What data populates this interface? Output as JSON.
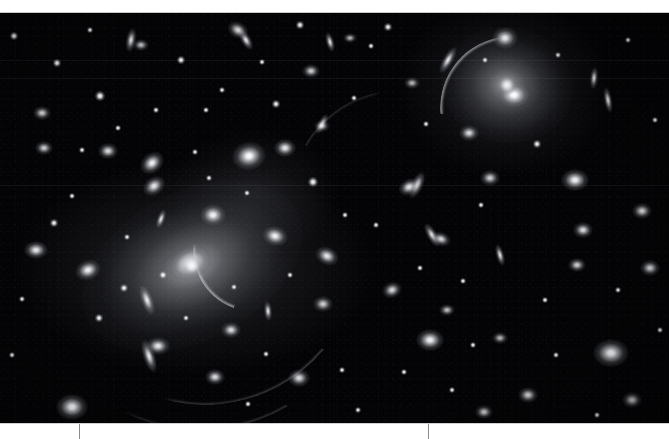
{
  "figure": {
    "kind": "astronomical-image",
    "background_color": "#030305",
    "margin_color": "#ffffff",
    "tick_color": "#8d8d8d",
    "width": 669,
    "height": 439
  },
  "frame": {
    "top_margin_height": 13,
    "image_top": 13,
    "image_bottom": 423,
    "bottom_margin_height": 16
  },
  "axis": {
    "orientation": "horizontal",
    "line_y": 423,
    "ticks": [
      {
        "id": "tick-1",
        "x": 79,
        "label": ""
      },
      {
        "id": "tick-2",
        "x": 428,
        "label": ""
      }
    ],
    "tick_length": 15,
    "labels": []
  },
  "seams": [
    {
      "y": 60,
      "note": "detector seam"
    },
    {
      "y": 78,
      "note": "detector seam"
    },
    {
      "y": 185,
      "note": "detector seam"
    }
  ],
  "objects": {
    "cd_galaxies": [
      {
        "name": "brightest-cluster-galaxy",
        "cx": 192,
        "cy": 266,
        "rx": 118,
        "ry": 74,
        "rot": -28,
        "peak": 1.0
      },
      {
        "name": "cd-galaxy-upper-right",
        "cx": 507,
        "cy": 85,
        "rx": 66,
        "ry": 58,
        "rot": 10,
        "peak": 0.95
      }
    ],
    "galaxies": [
      {
        "cx": 190,
        "cy": 263,
        "rx": 22,
        "ry": 16,
        "rot": -25,
        "b": 1.0
      },
      {
        "cx": 213,
        "cy": 215,
        "rx": 13,
        "ry": 11,
        "rot": 0,
        "b": 0.95
      },
      {
        "cx": 249,
        "cy": 156,
        "rx": 17,
        "ry": 14,
        "rot": -10,
        "b": 1.0
      },
      {
        "cx": 275,
        "cy": 236,
        "rx": 13,
        "ry": 10,
        "rot": 15,
        "b": 0.95
      },
      {
        "cx": 285,
        "cy": 148,
        "rx": 11,
        "ry": 9,
        "rot": 0,
        "b": 0.9
      },
      {
        "cx": 238,
        "cy": 30,
        "rx": 11,
        "ry": 8,
        "rot": 30,
        "b": 0.85
      },
      {
        "cx": 154,
        "cy": 186,
        "rx": 12,
        "ry": 9,
        "rot": -35,
        "b": 0.9
      },
      {
        "cx": 152,
        "cy": 163,
        "rx": 13,
        "ry": 10,
        "rot": -40,
        "b": 0.95
      },
      {
        "cx": 108,
        "cy": 151,
        "rx": 10,
        "ry": 8,
        "rot": 0,
        "b": 0.85
      },
      {
        "cx": 44,
        "cy": 148,
        "rx": 9,
        "ry": 7,
        "rot": 0,
        "b": 0.8
      },
      {
        "cx": 42,
        "cy": 113,
        "rx": 9,
        "ry": 7,
        "rot": 0,
        "b": 0.8
      },
      {
        "cx": 36,
        "cy": 250,
        "rx": 12,
        "ry": 9,
        "rot": 0,
        "b": 0.9
      },
      {
        "cx": 88,
        "cy": 270,
        "rx": 13,
        "ry": 10,
        "rot": -20,
        "b": 0.95
      },
      {
        "cx": 72,
        "cy": 407,
        "rx": 16,
        "ry": 13,
        "rot": 0,
        "b": 1.0
      },
      {
        "cx": 158,
        "cy": 346,
        "rx": 12,
        "ry": 9,
        "rot": 0,
        "b": 0.9
      },
      {
        "cx": 231,
        "cy": 330,
        "rx": 10,
        "ry": 8,
        "rot": 0,
        "b": 0.85
      },
      {
        "cx": 215,
        "cy": 377,
        "rx": 10,
        "ry": 8,
        "rot": 0,
        "b": 0.85
      },
      {
        "cx": 299,
        "cy": 378,
        "rx": 11,
        "ry": 9,
        "rot": 0,
        "b": 0.85
      },
      {
        "cx": 327,
        "cy": 256,
        "rx": 12,
        "ry": 9,
        "rot": 25,
        "b": 0.9
      },
      {
        "cx": 141,
        "cy": 45,
        "rx": 8,
        "ry": 6,
        "rot": 0,
        "b": 0.75
      },
      {
        "cx": 311,
        "cy": 71,
        "rx": 9,
        "ry": 7,
        "rot": 0,
        "b": 0.8
      },
      {
        "cx": 322,
        "cy": 126,
        "rx": 8,
        "ry": 6,
        "rot": 0,
        "b": 0.7
      },
      {
        "cx": 409,
        "cy": 187,
        "rx": 11,
        "ry": 8,
        "rot": -30,
        "b": 0.9
      },
      {
        "cx": 441,
        "cy": 239,
        "rx": 10,
        "ry": 7,
        "rot": 20,
        "b": 0.85
      },
      {
        "cx": 392,
        "cy": 290,
        "rx": 10,
        "ry": 8,
        "rot": -20,
        "b": 0.85
      },
      {
        "cx": 323,
        "cy": 304,
        "rx": 10,
        "ry": 8,
        "rot": 0,
        "b": 0.8
      },
      {
        "cx": 447,
        "cy": 310,
        "rx": 8,
        "ry": 6,
        "rot": 0,
        "b": 0.75
      },
      {
        "cx": 505,
        "cy": 38,
        "rx": 13,
        "ry": 11,
        "rot": 0,
        "b": 1.0
      },
      {
        "cx": 514,
        "cy": 95,
        "rx": 16,
        "ry": 13,
        "rot": 0,
        "b": 1.0
      },
      {
        "cx": 469,
        "cy": 133,
        "rx": 10,
        "ry": 8,
        "rot": 0,
        "b": 0.85
      },
      {
        "cx": 575,
        "cy": 180,
        "rx": 14,
        "ry": 11,
        "rot": 0,
        "b": 0.95
      },
      {
        "cx": 490,
        "cy": 178,
        "rx": 10,
        "ry": 8,
        "rot": 0,
        "b": 0.8
      },
      {
        "cx": 583,
        "cy": 230,
        "rx": 10,
        "ry": 8,
        "rot": 0,
        "b": 0.85
      },
      {
        "cx": 642,
        "cy": 211,
        "rx": 10,
        "ry": 8,
        "rot": 0,
        "b": 0.85
      },
      {
        "cx": 650,
        "cy": 268,
        "rx": 10,
        "ry": 8,
        "rot": 0,
        "b": 0.85
      },
      {
        "cx": 577,
        "cy": 265,
        "rx": 9,
        "ry": 7,
        "rot": 0,
        "b": 0.8
      },
      {
        "cx": 430,
        "cy": 340,
        "rx": 14,
        "ry": 11,
        "rot": 0,
        "b": 0.95
      },
      {
        "cx": 611,
        "cy": 353,
        "rx": 18,
        "ry": 14,
        "rot": 0,
        "b": 1.0
      },
      {
        "cx": 528,
        "cy": 395,
        "rx": 10,
        "ry": 8,
        "rot": 0,
        "b": 0.85
      },
      {
        "cx": 632,
        "cy": 400,
        "rx": 10,
        "ry": 8,
        "rot": 0,
        "b": 0.8
      },
      {
        "cx": 484,
        "cy": 412,
        "rx": 9,
        "ry": 7,
        "rot": 0,
        "b": 0.8
      },
      {
        "cx": 500,
        "cy": 338,
        "rx": 8,
        "ry": 6,
        "rot": 0,
        "b": 0.7
      },
      {
        "cx": 350,
        "cy": 38,
        "rx": 7,
        "ry": 5,
        "rot": 0,
        "b": 0.7
      },
      {
        "cx": 412,
        "cy": 83,
        "rx": 8,
        "ry": 6,
        "rot": 0,
        "b": 0.7
      }
    ],
    "edge_on_galaxies": [
      {
        "cx": 147,
        "cy": 300,
        "rx": 16,
        "ry": 6,
        "rot": 70
      },
      {
        "cx": 149,
        "cy": 356,
        "rx": 17,
        "ry": 6,
        "rot": 72
      },
      {
        "cx": 417,
        "cy": 185,
        "rx": 14,
        "ry": 6,
        "rot": 115
      },
      {
        "cx": 432,
        "cy": 235,
        "rx": 13,
        "ry": 5,
        "rot": 60
      },
      {
        "cx": 131,
        "cy": 40,
        "rx": 12,
        "ry": 5,
        "rot": 100
      },
      {
        "cx": 246,
        "cy": 40,
        "rx": 11,
        "ry": 5,
        "rot": 60
      },
      {
        "cx": 330,
        "cy": 42,
        "rx": 10,
        "ry": 4,
        "rot": 75
      },
      {
        "cx": 322,
        "cy": 124,
        "rx": 11,
        "ry": 4,
        "rot": 118
      },
      {
        "cx": 608,
        "cy": 100,
        "rx": 13,
        "ry": 4,
        "rot": 80
      },
      {
        "cx": 594,
        "cy": 78,
        "rx": 11,
        "ry": 4,
        "rot": 95
      },
      {
        "cx": 448,
        "cy": 60,
        "rx": 15,
        "ry": 5,
        "rot": 120
      },
      {
        "cx": 161,
        "cy": 219,
        "rx": 10,
        "ry": 4,
        "rot": 110
      },
      {
        "cx": 268,
        "cy": 311,
        "rx": 10,
        "ry": 4,
        "rot": 85
      },
      {
        "cx": 500,
        "cy": 255,
        "rx": 11,
        "ry": 4,
        "rot": 75
      }
    ],
    "lensing_arcs": [
      {
        "name": "central-arc",
        "cx": 255,
        "cy": 250,
        "r": 62,
        "start": 200,
        "sweep": 70,
        "thickness": 2.2,
        "brightness": 0.85
      },
      {
        "name": "arc-upper-right",
        "cx": 512,
        "cy": 108,
        "r": 72,
        "start": 265,
        "sweep": 80,
        "thickness": 2.0,
        "brightness": 0.8
      },
      {
        "name": "arc-lower-left",
        "cx": 205,
        "cy": 250,
        "r": 155,
        "start": 130,
        "sweep": 60,
        "thickness": 1.8,
        "brightness": 0.7
      },
      {
        "name": "arc-left",
        "cx": 200,
        "cy": 255,
        "r": 175,
        "start": 150,
        "sweep": 50,
        "thickness": 1.5,
        "brightness": 0.55
      },
      {
        "name": "arc-right-thin",
        "cx": 400,
        "cy": 200,
        "r": 110,
        "start": 300,
        "sweep": 45,
        "thickness": 1.2,
        "brightness": 0.5
      }
    ],
    "stars": [
      {
        "cx": 14,
        "cy": 36,
        "r": 2.0
      },
      {
        "cx": 57,
        "cy": 63,
        "r": 1.6
      },
      {
        "cx": 100,
        "cy": 96,
        "r": 2.2
      },
      {
        "cx": 181,
        "cy": 60,
        "r": 1.8
      },
      {
        "cx": 206,
        "cy": 110,
        "r": 1.5
      },
      {
        "cx": 222,
        "cy": 90,
        "r": 1.4
      },
      {
        "cx": 262,
        "cy": 62,
        "r": 1.5
      },
      {
        "cx": 276,
        "cy": 104,
        "r": 1.6
      },
      {
        "cx": 300,
        "cy": 25,
        "r": 1.6
      },
      {
        "cx": 313,
        "cy": 182,
        "r": 2.2
      },
      {
        "cx": 354,
        "cy": 98,
        "r": 1.4
      },
      {
        "cx": 371,
        "cy": 46,
        "r": 1.5
      },
      {
        "cx": 388,
        "cy": 27,
        "r": 1.6
      },
      {
        "cx": 247,
        "cy": 193,
        "r": 1.4
      },
      {
        "cx": 209,
        "cy": 178,
        "r": 1.3
      },
      {
        "cx": 156,
        "cy": 110,
        "r": 1.3
      },
      {
        "cx": 118,
        "cy": 128,
        "r": 1.4
      },
      {
        "cx": 72,
        "cy": 196,
        "r": 1.4
      },
      {
        "cx": 54,
        "cy": 223,
        "r": 1.6
      },
      {
        "cx": 22,
        "cy": 299,
        "r": 1.5
      },
      {
        "cx": 12,
        "cy": 355,
        "r": 1.4
      },
      {
        "cx": 99,
        "cy": 318,
        "r": 1.6
      },
      {
        "cx": 124,
        "cy": 288,
        "r": 1.6
      },
      {
        "cx": 163,
        "cy": 275,
        "r": 1.8
      },
      {
        "cx": 186,
        "cy": 318,
        "r": 1.4
      },
      {
        "cx": 266,
        "cy": 354,
        "r": 1.4
      },
      {
        "cx": 248,
        "cy": 404,
        "r": 1.5
      },
      {
        "cx": 342,
        "cy": 370,
        "r": 1.4
      },
      {
        "cx": 358,
        "cy": 410,
        "r": 1.4
      },
      {
        "cx": 404,
        "cy": 372,
        "r": 1.5
      },
      {
        "cx": 452,
        "cy": 390,
        "r": 1.4
      },
      {
        "cx": 473,
        "cy": 345,
        "r": 1.5
      },
      {
        "cx": 463,
        "cy": 281,
        "r": 1.5
      },
      {
        "cx": 420,
        "cy": 268,
        "r": 1.4
      },
      {
        "cx": 376,
        "cy": 225,
        "r": 1.3
      },
      {
        "cx": 345,
        "cy": 215,
        "r": 1.4
      },
      {
        "cx": 481,
        "cy": 205,
        "r": 1.5
      },
      {
        "cx": 537,
        "cy": 144,
        "r": 1.6
      },
      {
        "cx": 558,
        "cy": 55,
        "r": 1.5
      },
      {
        "cx": 628,
        "cy": 40,
        "r": 1.5
      },
      {
        "cx": 655,
        "cy": 120,
        "r": 1.5
      },
      {
        "cx": 618,
        "cy": 290,
        "r": 1.4
      },
      {
        "cx": 545,
        "cy": 300,
        "r": 1.4
      },
      {
        "cx": 556,
        "cy": 355,
        "r": 1.4
      },
      {
        "cx": 597,
        "cy": 415,
        "r": 1.5
      },
      {
        "cx": 660,
        "cy": 330,
        "r": 1.4
      },
      {
        "cx": 290,
        "cy": 275,
        "r": 1.5
      },
      {
        "cx": 234,
        "cy": 287,
        "r": 1.3
      },
      {
        "cx": 195,
        "cy": 152,
        "r": 1.4
      },
      {
        "cx": 127,
        "cy": 237,
        "r": 1.3
      },
      {
        "cx": 82,
        "cy": 150,
        "r": 1.3
      },
      {
        "cx": 426,
        "cy": 124,
        "r": 1.4
      },
      {
        "cx": 485,
        "cy": 60,
        "r": 1.3
      },
      {
        "cx": 90,
        "cy": 30,
        "r": 1.4
      }
    ]
  }
}
